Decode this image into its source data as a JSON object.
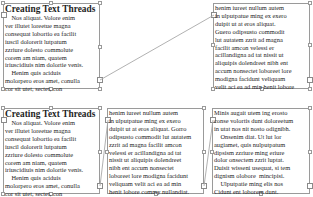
{
  "top_row": {
    "frame1": {
      "title": "Creating Text Threads",
      "lines": [
        "    Nos aliquat. Volore enim",
        "ver illutet loreetue magna",
        "consequat lobortio ea facilit",
        "iuscil dolorerit lutpatum",
        "zzriure dolesto commolute",
        "corem am niam, quatem",
        "iriuscidiuis nim dolortie venis.",
        "    Henim quis aciduis",
        "molorpero eros amet, conulla",
        "cor sit utet, sectet, con"
      ]
    },
    "frame2": {
      "lines": [
        "henim iureet nullum autem",
        "in ulputpatue ming ex exero",
        "duipit ut at eros aliquat.",
        "Guero odipsusto commodit",
        "lut autatem zzrit ad magna",
        "facilit amcon velessi er",
        "acillandigna ad tat nissit ut",
        "aliquipis dolendreet nibh ent",
        "accum nonsectet loboreet lore",
        "modigna facidunt veliquam",
        "velit aci ea ad min henit lobore"
      ]
    }
  },
  "bottom_row": {
    "frame1": {
      "title": "Creating Text Threads",
      "lines": [
        "    Nos aliquat. Volore enim",
        "ver illutet loreetue magna",
        "consequat lobortio ea facilit",
        "iuscil dolorerit lutpatum",
        "zzriure dolesto commolute",
        "corem am niam, quatem",
        "iriuscidiuis nim dolortie venis.",
        "    Henim quis aciduis",
        "molorpero eros amet, conulla",
        "cor sit utet, sectet, con"
      ]
    },
    "frame2": {
      "lines": [
        "henim iureet nullum autem",
        "in ulputpatue ming ex exero",
        "duipit ut at eros aliquat. Gorro",
        "odipsusto commodit lut autatem",
        "zzrit ad magna facilit amcon",
        "velessi er acillandigna ad tat",
        "nissit ut aliquipis dolendreet",
        "nibh ent accum nonsectet",
        "loboreet lore modigna facidunt",
        "veliquam velit aci ea ad min",
        "henit lobore commy nullandiat."
      ]
    },
    "frame3": {
      "lines": [
        "Minis augait utem ing erosto",
        "conse volortis dunt doloreetum",
        "in utat nos nit nosto odignibh.",
        "    Onsenim diat. Ut lut lor",
        "augiamet, quis nulputpatum",
        "dipsism zzriure ming eriure",
        "dolor onsectem zzrit luptat.",
        "Duisit wisseni usequat, si tem",
        "dignism olobore  mincipisi.",
        "    Ulputpatie ming elis nos",
        "Cidunt ent loborem dunt."
      ]
    }
  },
  "colors": {
    "frame_border": "#9a9a9a",
    "thread_line": "#a0a0a0",
    "text": "#1e1e1e"
  }
}
